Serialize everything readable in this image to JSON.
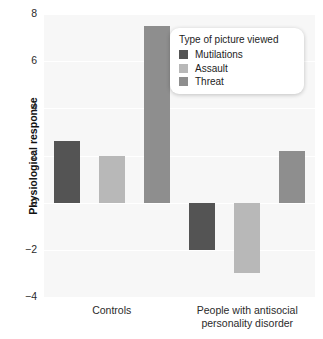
{
  "chart_data": {
    "type": "bar",
    "title": "",
    "subtitle": "",
    "xlabel": "",
    "ylabel": "Physiological response",
    "ylim": [
      -4,
      8
    ],
    "yticks": [
      8,
      6,
      4,
      2,
      0,
      -2,
      -4
    ],
    "ytick_labels": [
      "8",
      "6",
      "4",
      "2",
      "0",
      "−2",
      "−4"
    ],
    "grid": true,
    "grid_axis": "y",
    "legend_position": "top-right",
    "legend_title": "Type of picture viewed",
    "categories": [
      "Controls",
      "People with antisocial personality disorder"
    ],
    "category_label_lines": [
      [
        "Controls"
      ],
      [
        "People with antisocial",
        "personality disorder"
      ]
    ],
    "series": [
      {
        "name": "Mutilations",
        "color": "#545454",
        "values": [
          2.6,
          -2.0
        ]
      },
      {
        "name": "Assault",
        "color": "#b8b8b8",
        "values": [
          2.0,
          -3.0
        ]
      },
      {
        "name": "Threat",
        "color": "#8e8e8e",
        "values": [
          7.5,
          2.2
        ]
      }
    ]
  },
  "axis": {
    "y_title": "Physiological response",
    "tick_8": "8",
    "tick_6": "6",
    "tick_4": "4",
    "tick_2": "2",
    "tick_0": "0",
    "tick_m2": "−2",
    "tick_m4": "−4"
  },
  "legend": {
    "title": "Type of picture viewed",
    "items": [
      {
        "label": "Mutilations",
        "color": "#545454"
      },
      {
        "label": "Assault",
        "color": "#b8b8b8"
      },
      {
        "label": "Threat",
        "color": "#8e8e8e"
      }
    ]
  },
  "x_categories": [
    {
      "line1": "Controls",
      "line2": ""
    },
    {
      "line1": "People with antisocial",
      "line2": "personality disorder"
    }
  ],
  "top_caption": "",
  "colors": {
    "panel_background": "#f7f7f7",
    "gridline": "#ffffff",
    "text": "#2b2b2b",
    "mutilations": "#545454",
    "assault": "#b8b8b8",
    "threat": "#8e8e8e"
  }
}
